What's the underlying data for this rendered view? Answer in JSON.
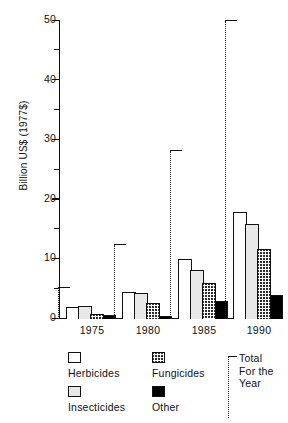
{
  "chart_data": {
    "type": "bar",
    "title": "",
    "xlabel": "",
    "ylabel": "Billion US$ (1977$)",
    "categories": [
      "1975",
      "1980",
      "1985",
      "1990"
    ],
    "ylim": [
      0,
      50
    ],
    "yticks": [
      0,
      10,
      20,
      30,
      40,
      50
    ],
    "ytick_labels": [
      "0",
      "10",
      "20",
      "30",
      "40",
      "50"
    ],
    "yminor_ticks": [
      5,
      15,
      25,
      35,
      45
    ],
    "grid": false,
    "legend_position": "below-axes",
    "series": [
      {
        "name": "Herbicides",
        "pattern": "open",
        "values": [
          2.0,
          4.6,
          10.0,
          18.0
        ]
      },
      {
        "name": "Insecticides",
        "pattern": "light-gray",
        "values": [
          2.1,
          4.4,
          8.3,
          16.0
        ]
      },
      {
        "name": "Fungicides",
        "pattern": "cross-hatch",
        "values": [
          0.8,
          2.7,
          6.0,
          11.7
        ]
      },
      {
        "name": "Other",
        "pattern": "solid-black",
        "values": [
          0.6,
          0.5,
          3.0,
          4.0
        ]
      }
    ],
    "totals": {
      "name": "Total For the Year",
      "marker": "dotted-bracket",
      "values": [
        5.2,
        12.4,
        28.2,
        50.0
      ]
    },
    "annotations": []
  },
  "legend": {
    "items": [
      {
        "label": "Herbicides",
        "swatch": "open-square-icon"
      },
      {
        "label": "Insecticides",
        "swatch": "gray-square-icon"
      },
      {
        "label": "Fungicides",
        "swatch": "hatched-square-icon"
      },
      {
        "label": "Other",
        "swatch": "black-square-icon"
      }
    ],
    "total": {
      "line1": "Total",
      "line2": "For the",
      "line3": "Year"
    }
  },
  "colors": {
    "ink": "#111111",
    "herbicides": "#ffffff",
    "insecticides": "#e8e8e8",
    "fungicides": "#2a2a2a",
    "other": "#000000",
    "background": "#ffffff"
  }
}
